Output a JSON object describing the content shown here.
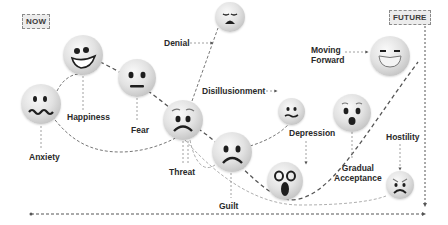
{
  "diagram": {
    "start_tag": "NOW",
    "end_tag": "FUTURE",
    "stages": [
      {
        "id": "anxiety",
        "label": "Anxiety",
        "face": "wavy-mouth"
      },
      {
        "id": "happiness",
        "label": "Happiness",
        "face": "big-grin"
      },
      {
        "id": "fear",
        "label": "Fear",
        "face": "neutral-flat-mouth"
      },
      {
        "id": "threat",
        "label": "Threat",
        "face": "worried-frown"
      },
      {
        "id": "denial",
        "label": "Denial",
        "face": "weary"
      },
      {
        "id": "disillusionment",
        "label": "Disillusionment",
        "face": "confounded"
      },
      {
        "id": "guilt",
        "label": "Guilt",
        "face": "frown"
      },
      {
        "id": "depression",
        "label": "Depression",
        "face": "scream"
      },
      {
        "id": "gradual_acceptance",
        "label": "Gradual Acceptance",
        "label_lines": [
          "Gradual",
          "Acceptance"
        ],
        "face": "surprised"
      },
      {
        "id": "moving_forward",
        "label": "Moving Forward",
        "label_lines": [
          "Moving",
          "Forward"
        ],
        "face": "grinning-squint"
      },
      {
        "id": "hostility",
        "label": "Hostility",
        "face": "angry"
      }
    ],
    "colors": {
      "line": "#7a7a7a",
      "text": "#2a2a2a",
      "tag_bg": "#ececec",
      "face_feature": "#1e1e1e"
    }
  }
}
